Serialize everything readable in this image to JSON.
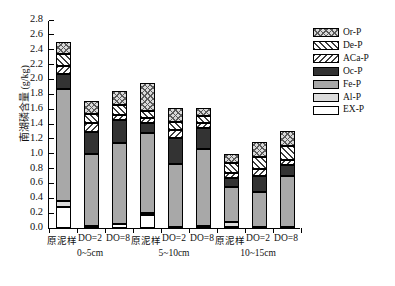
{
  "chart_data": {
    "type": "bar",
    "stacked": true,
    "title": "",
    "xlabel": "",
    "ylabel": "南湖磷含量 (g/kg)",
    "ylim": [
      0.0,
      2.8
    ],
    "ytick_step": 0.2,
    "yticks": [
      "0.0",
      "0.2",
      "0.4",
      "0.6",
      "0.8",
      "1.0",
      "1.2",
      "1.4",
      "1.6",
      "1.8",
      "2.0",
      "2.2",
      "2.4",
      "2.6",
      "2.8"
    ],
    "grid": false,
    "legend_position": "right",
    "categories": [
      "原泥样",
      "DO=2",
      "DO=8",
      "原泥样",
      "DO=2",
      "DO=8",
      "原泥样",
      "DO=2",
      "DO=8"
    ],
    "groups": [
      {
        "label": "0~5cm",
        "categories": [
          "原泥样",
          "DO=2",
          "DO=8"
        ]
      },
      {
        "label": "5~10cm",
        "categories": [
          "原泥样",
          "DO=2",
          "DO=8"
        ]
      },
      {
        "label": "10~15cm",
        "categories": [
          "原泥样",
          "DO=2",
          "DO=8"
        ]
      }
    ],
    "series": [
      {
        "name": "EX-P",
        "pattern": "white",
        "values": [
          0.28,
          0.03,
          0.05,
          0.17,
          0.02,
          0.03,
          0.02,
          0.02,
          0.02
        ]
      },
      {
        "name": "Al-P",
        "pattern": "light-gray",
        "values": [
          0.08,
          0.0,
          0.0,
          0.03,
          0.0,
          0.0,
          0.06,
          0.0,
          0.0
        ]
      },
      {
        "name": "Fe-P",
        "pattern": "medium-gray",
        "values": [
          1.51,
          0.96,
          1.09,
          1.08,
          0.84,
          1.04,
          0.47,
          0.47,
          0.68
        ]
      },
      {
        "name": "Oc-P",
        "pattern": "dark",
        "values": [
          0.2,
          0.3,
          0.31,
          0.13,
          0.35,
          0.28,
          0.13,
          0.21,
          0.15
        ]
      },
      {
        "name": "ACa-P",
        "pattern": "backslash-hatch",
        "values": [
          0.11,
          0.13,
          0.07,
          0.07,
          0.11,
          0.07,
          0.06,
          0.1,
          0.07
        ]
      },
      {
        "name": "De-P",
        "pattern": "slash-hatch",
        "values": [
          0.16,
          0.12,
          0.14,
          0.1,
          0.11,
          0.09,
          0.14,
          0.16,
          0.18
        ]
      },
      {
        "name": "Or-P",
        "pattern": "crosshatch",
        "values": [
          0.17,
          0.17,
          0.19,
          0.37,
          0.18,
          0.1,
          0.12,
          0.2,
          0.21
        ]
      }
    ],
    "totals": [
      2.51,
      1.71,
      1.85,
      1.95,
      1.61,
      1.61,
      1.0,
      1.16,
      1.31
    ]
  },
  "legend": {
    "items": [
      {
        "label": "Or-P",
        "key": "Or-P"
      },
      {
        "label": "De-P",
        "key": "De-P"
      },
      {
        "label": "ACa-P",
        "key": "ACa-P"
      },
      {
        "label": "Oc-P",
        "key": "Oc-P"
      },
      {
        "label": "Fe-P",
        "key": "Fe-P"
      },
      {
        "label": "Al-P",
        "key": "Al-P"
      },
      {
        "label": "EX-P",
        "key": "EX-P"
      }
    ]
  },
  "colors": {
    "axis": "#000000",
    "or_p": "#d9d9d9",
    "de_p": "#ffffff",
    "aca_p": "#ffffff",
    "oc_p": "#333333",
    "fe_p": "#a8a8a8",
    "al_p": "#dcdcdc",
    "ex_p": "#ffffff"
  }
}
